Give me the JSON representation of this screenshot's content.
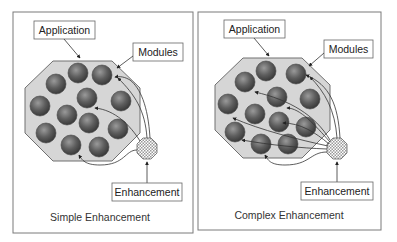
{
  "panels": [
    {
      "id": "simple",
      "caption": "Simple Enhancement",
      "labels": {
        "application": "Application",
        "modules": "Modules",
        "enhancement": "Enhancement"
      },
      "module_count": 12,
      "connections": 4
    },
    {
      "id": "complex",
      "caption": "Complex Enhancement",
      "labels": {
        "application": "Application",
        "modules": "Modules",
        "enhancement": "Enhancement"
      },
      "module_count": 12,
      "connections": 8
    }
  ],
  "colors": {
    "panel_border": "#7a7a7a",
    "application_fill": "#d4d4d4",
    "application_stroke": "#6e6e6e",
    "module_dark": "#3f3f3f",
    "module_light": "#8a8a8a",
    "arrow": "#333333",
    "label_border": "#666666"
  }
}
